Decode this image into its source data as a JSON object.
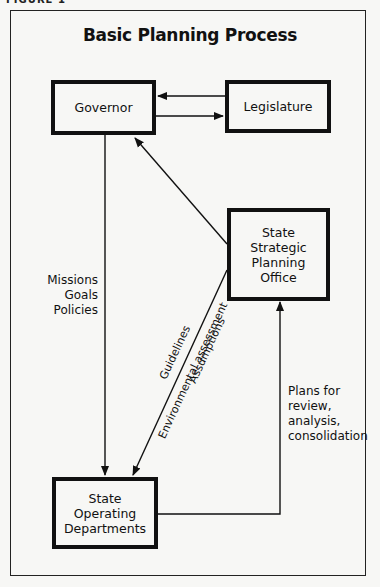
{
  "figure_label": "FIGURE 1",
  "title": "Basic Planning Process",
  "nodes": {
    "governor": "Governor",
    "legislature": "Legislature",
    "strategic_office": [
      "State",
      "Strategic",
      "Planning",
      "Office"
    ],
    "operating_departments": [
      "State",
      "Operating",
      "Departments"
    ]
  },
  "edge_labels": {
    "governor_to_departments": [
      "Missions",
      "Goals",
      "Policies"
    ],
    "office_to_departments": [
      "Guidelines",
      "Environmental assessment",
      "Assumptions"
    ],
    "departments_to_office": [
      "Plans for",
      "review,",
      "analysis,",
      "consolidation"
    ]
  },
  "colors": {
    "stroke": "#111111",
    "background": "#f7f7f5"
  }
}
